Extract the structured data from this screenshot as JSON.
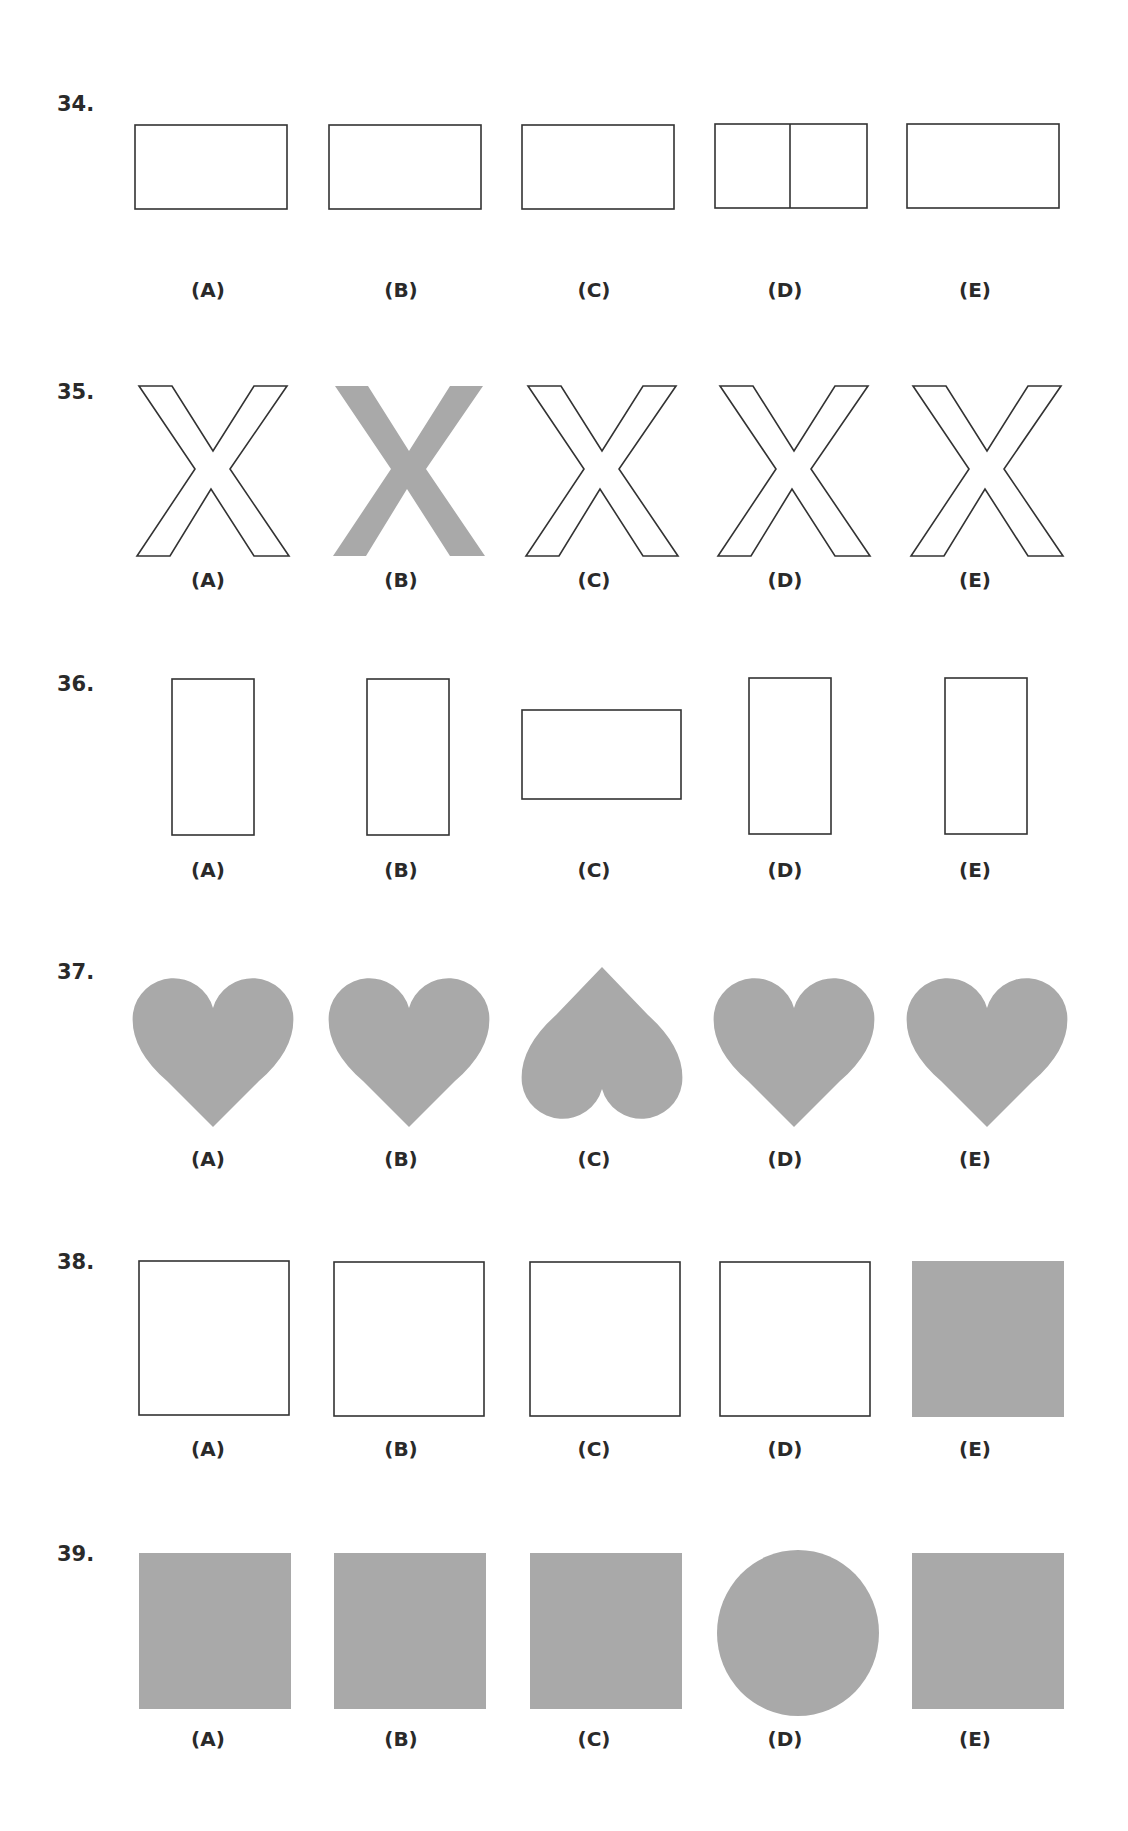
{
  "colors": {
    "fill_gray": "#a9a9a9",
    "stroke": "#333333",
    "background": "#ffffff"
  },
  "questions": [
    {
      "number": "34.",
      "options": [
        {
          "label": "(A)",
          "shape": "horizontal-rectangle",
          "style": "outline"
        },
        {
          "label": "(B)",
          "shape": "horizontal-rectangle",
          "style": "outline"
        },
        {
          "label": "(C)",
          "shape": "horizontal-rectangle",
          "style": "outline"
        },
        {
          "label": "(D)",
          "shape": "horizontal-rectangle-divided",
          "style": "outline"
        },
        {
          "label": "(E)",
          "shape": "horizontal-rectangle",
          "style": "outline"
        }
      ]
    },
    {
      "number": "35.",
      "options": [
        {
          "label": "(A)",
          "shape": "letter-x",
          "style": "outline"
        },
        {
          "label": "(B)",
          "shape": "letter-x",
          "style": "filled-gray"
        },
        {
          "label": "(C)",
          "shape": "letter-x",
          "style": "outline"
        },
        {
          "label": "(D)",
          "shape": "letter-x",
          "style": "outline"
        },
        {
          "label": "(E)",
          "shape": "letter-x",
          "style": "outline"
        }
      ]
    },
    {
      "number": "36.",
      "options": [
        {
          "label": "(A)",
          "shape": "vertical-rectangle",
          "style": "outline"
        },
        {
          "label": "(B)",
          "shape": "vertical-rectangle",
          "style": "outline"
        },
        {
          "label": "(C)",
          "shape": "horizontal-rectangle",
          "style": "outline"
        },
        {
          "label": "(D)",
          "shape": "vertical-rectangle",
          "style": "outline"
        },
        {
          "label": "(E)",
          "shape": "vertical-rectangle",
          "style": "outline"
        }
      ]
    },
    {
      "number": "37.",
      "options": [
        {
          "label": "(A)",
          "shape": "heart",
          "style": "filled-gray"
        },
        {
          "label": "(B)",
          "shape": "heart",
          "style": "filled-gray"
        },
        {
          "label": "(C)",
          "shape": "heart-inverted",
          "style": "filled-gray"
        },
        {
          "label": "(D)",
          "shape": "heart",
          "style": "filled-gray"
        },
        {
          "label": "(E)",
          "shape": "heart",
          "style": "filled-gray"
        }
      ]
    },
    {
      "number": "38.",
      "options": [
        {
          "label": "(A)",
          "shape": "square",
          "style": "outline"
        },
        {
          "label": "(B)",
          "shape": "square",
          "style": "outline"
        },
        {
          "label": "(C)",
          "shape": "square",
          "style": "outline"
        },
        {
          "label": "(D)",
          "shape": "square",
          "style": "outline"
        },
        {
          "label": "(E)",
          "shape": "square",
          "style": "filled-gray"
        }
      ]
    },
    {
      "number": "39.",
      "options": [
        {
          "label": "(A)",
          "shape": "square",
          "style": "filled-gray"
        },
        {
          "label": "(B)",
          "shape": "square",
          "style": "filled-gray"
        },
        {
          "label": "(C)",
          "shape": "square",
          "style": "filled-gray"
        },
        {
          "label": "(D)",
          "shape": "circle",
          "style": "filled-gray"
        },
        {
          "label": "(E)",
          "shape": "square",
          "style": "filled-gray"
        }
      ]
    }
  ]
}
